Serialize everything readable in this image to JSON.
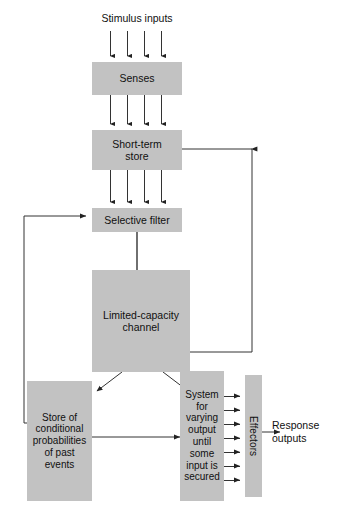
{
  "diagram": {
    "type": "flow-diagram",
    "box_fill_color": "#c2c2c2",
    "line_color": "#333333",
    "background_color": "#ffffff",
    "labels": {
      "stimulus_inputs": "Stimulus inputs",
      "response_outputs": "Response outputs"
    },
    "boxes": {
      "senses": "Senses",
      "short_term_store_line1": "Short-term",
      "short_term_store_line2": "store",
      "selective_filter": "Selective filter",
      "limited_capacity_line1": "Limited-capacity",
      "limited_capacity_line2": "channel",
      "store_line1": "Store of",
      "store_line2": "conditional",
      "store_line3": "probabilities",
      "store_line4": "of past",
      "store_line5": "events",
      "system_line1": "System",
      "system_line2": "for",
      "system_line3": "varying",
      "system_line4": "output",
      "system_line5": "until",
      "system_line6": "some",
      "system_line7": "input is",
      "system_line8": "secured",
      "effectors": "Effectors"
    },
    "connection_counts": {
      "stimulus_to_senses": 4,
      "senses_to_short_term_store": 4,
      "short_term_store_to_filter": 4,
      "system_to_effectors": 7
    }
  }
}
